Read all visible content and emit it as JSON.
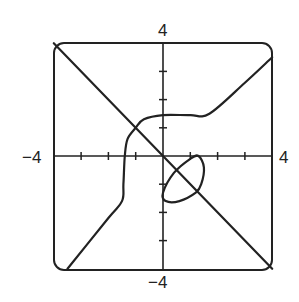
{
  "chart_data": {
    "type": "line",
    "title": "",
    "xlabel": "",
    "ylabel": "",
    "xlim": [
      -4,
      4
    ],
    "ylim": [
      -4,
      4
    ],
    "grid": false,
    "tick_labels": {
      "x_min": "−4",
      "x_max": "4",
      "y_min": "−4",
      "y_max": "4"
    },
    "ticks": {
      "x": [
        -3,
        -2,
        -1,
        1,
        2,
        3
      ],
      "y": [
        -3,
        -2,
        -1,
        1,
        2,
        3
      ]
    },
    "series": [
      {
        "name": "line y = -x",
        "points": [
          [
            -4,
            4
          ],
          [
            4,
            -4
          ]
        ]
      },
      {
        "name": "curve branch (upper-right to lower-left)",
        "points": [
          [
            4,
            3.5
          ],
          [
            3,
            2.6
          ],
          [
            1.7,
            1.5
          ],
          [
            1,
            1.45
          ],
          [
            0,
            1.45
          ],
          [
            -0.7,
            1.3
          ],
          [
            -1.0,
            1.0
          ],
          [
            -1.3,
            0.6
          ],
          [
            -1.4,
            0
          ],
          [
            -1.45,
            -1.0
          ],
          [
            -1.5,
            -1.6
          ],
          [
            -2.0,
            -2.2
          ],
          [
            -3.5,
            -4
          ]
        ]
      },
      {
        "name": "closed loop near origin",
        "points": [
          [
            0,
            -1.3
          ],
          [
            0.4,
            -0.6
          ],
          [
            1.0,
            -0.1
          ],
          [
            1.3,
            0
          ],
          [
            1.5,
            -0.4
          ],
          [
            1.4,
            -1.0
          ],
          [
            1.2,
            -1.3
          ],
          [
            0.6,
            -1.6
          ],
          [
            0.1,
            -1.6
          ],
          [
            0,
            -1.3
          ]
        ]
      }
    ]
  },
  "axes_labels": {
    "top": "4",
    "bottom": "−4",
    "left": "−4",
    "right": "4"
  }
}
